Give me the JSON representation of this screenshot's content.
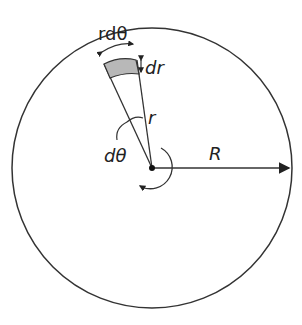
{
  "diagram": {
    "labels": {
      "arc_length": "rdθ",
      "radial_width": "dr",
      "radius_small": "r",
      "angle": "dθ",
      "radius_big": "R"
    },
    "colors": {
      "stroke": "#333333",
      "element_fill": "#b8b8b8",
      "background": "#ffffff"
    }
  }
}
